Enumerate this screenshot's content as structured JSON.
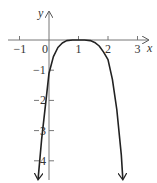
{
  "chart_data": {
    "type": "line",
    "title": "",
    "xlabel": "x",
    "ylabel": "y",
    "xlim": [
      -1.1,
      3.3
    ],
    "ylim": [
      -4.6,
      0.9
    ],
    "grid": false,
    "x_ticks": [
      -1,
      0,
      1,
      2,
      3
    ],
    "x_tick_labels": [
      "−1",
      "0",
      "1",
      "2",
      "3"
    ],
    "y_ticks": [
      -1,
      -2,
      -3,
      -4
    ],
    "y_tick_labels": [
      "−1",
      "2",
      "3",
      "4"
    ],
    "series": [
      {
        "name": "curve",
        "color": "#222222",
        "arrows": "both ends",
        "x": [
          -0.37,
          -0.25,
          -0.1,
          0.0,
          0.15,
          0.3,
          0.45,
          0.6,
          0.8,
          1.0,
          1.2,
          1.4,
          1.55,
          1.7,
          1.85,
          2.0,
          2.15,
          2.3,
          2.45,
          2.5
        ],
        "y": [
          -4.6,
          -3.3,
          -2.0,
          -1.1,
          -0.55,
          -0.25,
          -0.1,
          -0.02,
          0.0,
          0.0,
          0.0,
          -0.02,
          -0.08,
          -0.2,
          -0.4,
          -0.65,
          -1.3,
          -2.3,
          -3.8,
          -4.6
        ]
      }
    ]
  },
  "axes": {
    "x_label": "x",
    "y_label": "y"
  }
}
